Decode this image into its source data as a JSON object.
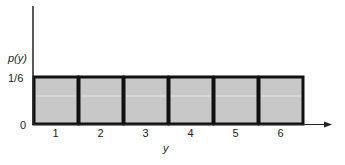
{
  "chart_data": {
    "type": "bar",
    "title": "",
    "xlabel": "y",
    "ylabel": "p(y)",
    "categories": [
      "1",
      "2",
      "3",
      "4",
      "5",
      "6"
    ],
    "values": [
      0.1667,
      0.1667,
      0.1667,
      0.1667,
      0.1667,
      0.1667
    ],
    "value_labels": [
      "1/6",
      "1/6",
      "1/6",
      "1/6",
      "1/6",
      "1/6"
    ],
    "y_ticks": [
      "0",
      "1/6"
    ],
    "ylim": [
      0,
      0.35
    ],
    "grid": false,
    "legend": null,
    "bar_color": "#c8c8c8",
    "edge_color": "#111111"
  },
  "labels": {
    "ylabel": "p(y)",
    "xlabel": "y",
    "ytick_top": "1/6",
    "ytick_zero": "0"
  }
}
